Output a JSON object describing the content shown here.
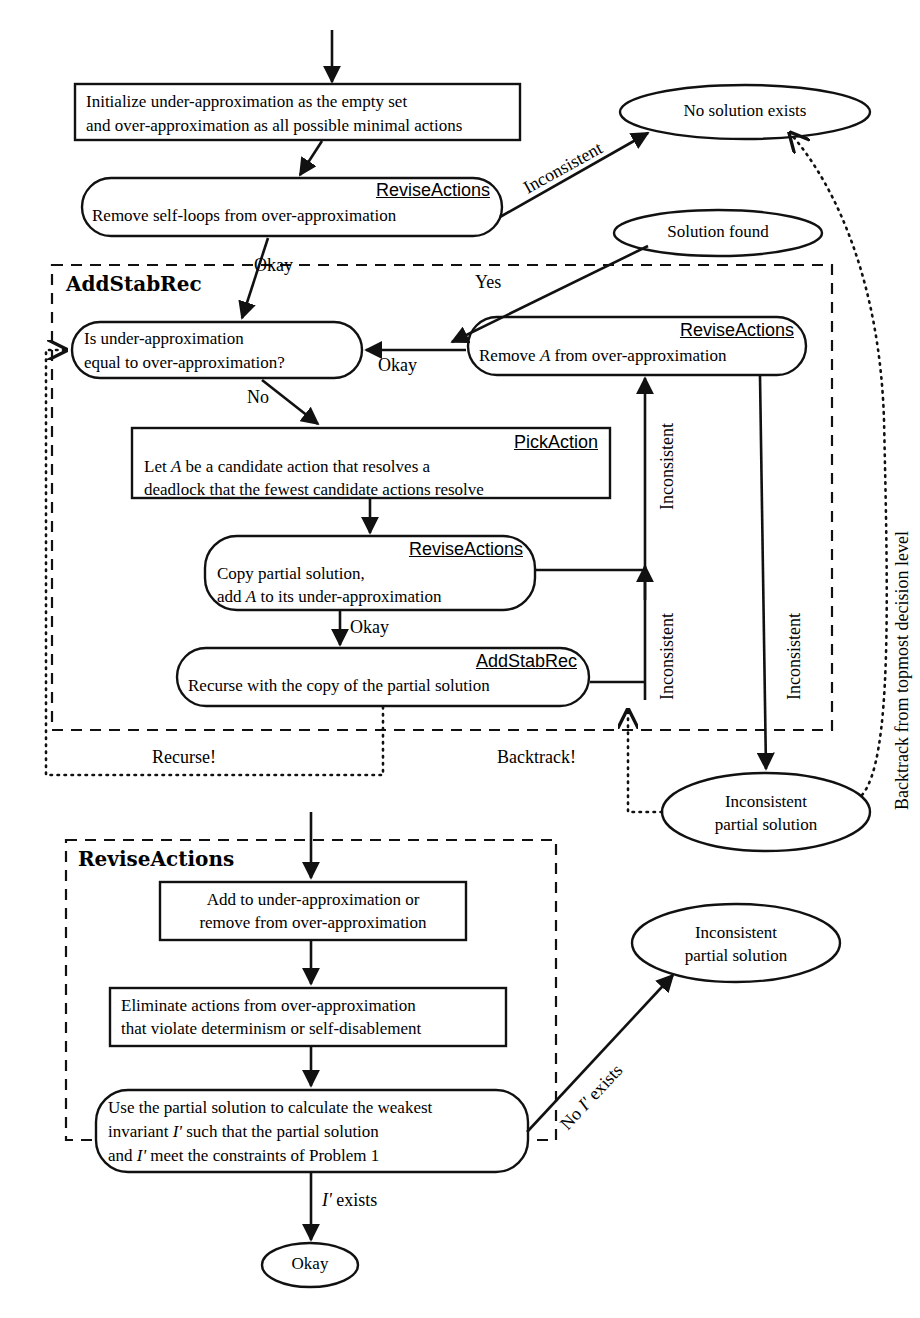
{
  "diagram": {
    "stroke_color": "#111111",
    "background": "#ffffff"
  },
  "nodes": {
    "initialize": {
      "shape": "rect",
      "line1": "Initialize under-approximation as the empty set",
      "line2": "and over-approximation as all possible minimal actions"
    },
    "revise_selfloops": {
      "shape": "rounded",
      "routine": "ReviseActions",
      "line1": "Remove self-loops from over-approximation"
    },
    "no_solution": {
      "shape": "ellipse",
      "label": "No solution exists"
    },
    "solution_found": {
      "shape": "ellipse",
      "label": "Solution found"
    },
    "decision": {
      "shape": "rounded",
      "line1": "Is under-approximation",
      "line2": "equal to over-approximation?"
    },
    "revise_remove_a": {
      "shape": "rounded",
      "routine": "ReviseActions",
      "line1_a": "Remove ",
      "line1_var": "A",
      "line1_b": " from over-approximation"
    },
    "pick_action": {
      "shape": "rect",
      "routine": "PickAction",
      "line1_a": "Let ",
      "line1_var": "A",
      "line1_b": " be a candidate action that resolves a",
      "line2": "deadlock that the fewest candidate actions resolve"
    },
    "revise_copy": {
      "shape": "rounded",
      "routine": "ReviseActions",
      "line1": "Copy partial solution,",
      "line2_a": "add ",
      "line2_var": "A",
      "line2_b": " to its under-approximation"
    },
    "recurse": {
      "shape": "rounded",
      "routine": "AddStabRec",
      "line1": "Recurse with the copy of the partial solution"
    },
    "inconsistent_partial_1": {
      "shape": "ellipse",
      "line1": "Inconsistent",
      "line2": "partial solution"
    },
    "add_or_remove": {
      "shape": "rect",
      "line1": "Add to under-approximation or",
      "line2": "remove from over-approximation"
    },
    "eliminate": {
      "shape": "rect",
      "line1": "Eliminate actions from over-approximation",
      "line2": "that violate determinism or self-disablement"
    },
    "weakest_invariant": {
      "shape": "rounded",
      "line1": "Use the partial solution to calculate the weakest",
      "line2_a": "invariant ",
      "line2_var": "I'",
      "line2_b": " such that the partial solution",
      "line3_a": "and ",
      "line3_var": "I'",
      "line3_b": " meet the constraints of Problem 1"
    },
    "inconsistent_partial_2": {
      "shape": "ellipse",
      "line1": "Inconsistent",
      "line2": "partial solution"
    },
    "okay_terminal": {
      "shape": "ellipse",
      "label": "Okay"
    }
  },
  "groups": {
    "addstabrec": {
      "label": "AddStabRec",
      "style": "dashed"
    },
    "reviseactions": {
      "label": "ReviseActions",
      "style": "dashed"
    }
  },
  "edge_labels": {
    "inconsistent_top": "Inconsistent",
    "okay_enter": "Okay",
    "yes": "Yes",
    "okay_return": "Okay",
    "no": "No",
    "okay_recurse": "Okay",
    "inconsistent_v1": "Inconsistent",
    "inconsistent_v2": "Inconsistent",
    "inconsistent_v3": "Inconsistent",
    "backtrack_topmost": "Backtrack from topmost decision level",
    "recurse_bang": "Recurse!",
    "backtrack_bang": "Backtrack!",
    "no_i_exists_a": "No ",
    "no_i_exists_var": "I'",
    "no_i_exists_b": " exists",
    "i_exists_var": "I'",
    "i_exists_b": " exists"
  }
}
